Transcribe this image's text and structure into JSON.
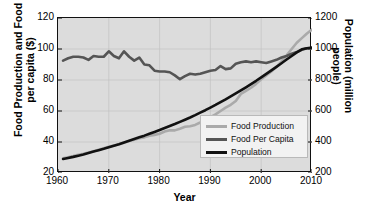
{
  "chart_data": {
    "type": "line",
    "title": "",
    "xlabel": "Year",
    "ylabel_left": "Food Production and Food per capita ($)",
    "ylabel_right": "Population (million people)",
    "xlim": [
      1960,
      2010
    ],
    "xticks": [
      1960,
      1970,
      1980,
      1990,
      2000,
      2010
    ],
    "ylim_left": [
      20,
      120
    ],
    "yticks_left": [
      20,
      40,
      60,
      80,
      100,
      120
    ],
    "ylim_right": [
      200,
      1200
    ],
    "yticks_right": [
      200,
      400,
      600,
      800,
      1000,
      1200
    ],
    "grid": true,
    "legend_position": "lower right",
    "plot_background": "#dcdcdc",
    "x": [
      1961,
      1962,
      1963,
      1964,
      1965,
      1966,
      1967,
      1968,
      1969,
      1970,
      1971,
      1972,
      1973,
      1974,
      1975,
      1976,
      1977,
      1978,
      1979,
      1980,
      1981,
      1982,
      1983,
      1984,
      1985,
      1986,
      1987,
      1988,
      1989,
      1990,
      1991,
      1992,
      1993,
      1994,
      1995,
      1996,
      1997,
      1998,
      1999,
      2000,
      2001,
      2002,
      2003,
      2004,
      2005,
      2006,
      2007,
      2008,
      2009,
      2010
    ],
    "series": [
      {
        "name": "Food Production",
        "color": "#aaaaaa",
        "axis": "left",
        "values": [
          29.5,
          30.2,
          30.9,
          31.8,
          32.4,
          33.2,
          34.1,
          35.0,
          35.9,
          36.9,
          37.8,
          38.5,
          39.5,
          40.6,
          41.5,
          42.4,
          43.0,
          44.0,
          44.6,
          45.3,
          46.8,
          47.6,
          47.5,
          48.6,
          49.8,
          50.2,
          51.0,
          52.6,
          54.3,
          56.0,
          57.8,
          60.0,
          62.2,
          64.0,
          66.5,
          71.0,
          73.0,
          75.0,
          77.5,
          80.5,
          83.0,
          85.5,
          88.5,
          92.0,
          96.0,
          100.0,
          104.0,
          107.0,
          110.0,
          112.5
        ]
      },
      {
        "name": "Food Per Capita",
        "color": "#555555",
        "axis": "left",
        "values": [
          92.5,
          94.0,
          95.0,
          95.0,
          94.5,
          93.0,
          95.5,
          95.0,
          95.0,
          98.5,
          95.5,
          94.0,
          98.5,
          95.0,
          92.5,
          94.5,
          90.0,
          89.5,
          86.0,
          85.5,
          85.5,
          85.0,
          83.0,
          80.5,
          82.5,
          84.0,
          83.5,
          84.0,
          85.0,
          86.0,
          86.5,
          89.0,
          87.0,
          87.5,
          90.5,
          91.5,
          92.0,
          91.5,
          92.0,
          91.5,
          91.0,
          92.0,
          93.0,
          94.5,
          95.5,
          97.0,
          98.0,
          99.5,
          100.5,
          100.5
        ]
      },
      {
        "name": "Population",
        "color": "#111111",
        "axis": "right",
        "values": [
          290,
          297,
          304,
          312,
          320,
          329,
          338,
          347,
          356,
          366,
          376,
          386,
          397,
          408,
          419,
          430,
          441,
          453,
          465,
          477,
          490,
          503,
          516,
          530,
          544,
          558,
          573,
          589,
          605,
          622,
          639,
          657,
          675,
          694,
          713,
          733,
          753,
          774,
          795,
          817,
          839,
          862,
          885,
          908,
          932,
          955,
          978,
          998,
          1005,
          1010
        ]
      }
    ]
  }
}
